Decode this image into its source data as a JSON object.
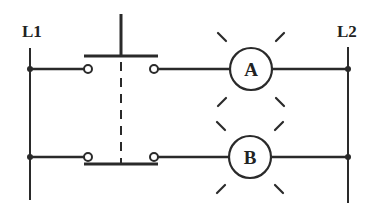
{
  "diagram": {
    "type": "ladder-logic",
    "colors": {
      "line": "#2a2a2a",
      "background": "#ffffff"
    },
    "rails": {
      "left": {
        "label": "L1"
      },
      "right": {
        "label": "L2"
      }
    },
    "pushbutton": {
      "type": "double-circuit",
      "contacts": [
        "normally-open",
        "normally-closed"
      ]
    },
    "lamps": [
      {
        "label": "A",
        "rung": 1,
        "state": "lit"
      },
      {
        "label": "B",
        "rung": 2,
        "state": "lit"
      }
    ]
  }
}
